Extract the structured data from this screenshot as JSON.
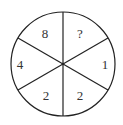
{
  "diagram": {
    "type": "number-wheel-puzzle",
    "segments": [
      {
        "position": "top-left",
        "value": "8"
      },
      {
        "position": "top-right",
        "value": "?"
      },
      {
        "position": "right",
        "value": "1"
      },
      {
        "position": "bottom-right",
        "value": "2"
      },
      {
        "position": "bottom-left",
        "value": "2"
      },
      {
        "position": "left",
        "value": "4"
      }
    ],
    "colors": {
      "stroke": "#222222",
      "text": "#333333",
      "background": "#ffffff"
    }
  }
}
